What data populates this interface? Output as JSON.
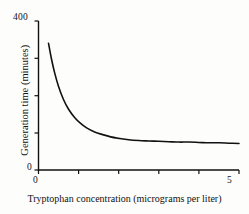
{
  "chart_data": {
    "type": "line",
    "title": "",
    "subtitle": "",
    "xlabel": "Tryptophan concentration (micrograms per liter)",
    "ylabel": "Generation time (minutes)",
    "xlim": [
      0,
      5
    ],
    "ylim": [
      0,
      400
    ],
    "xticks": [
      0,
      1,
      2,
      3,
      4,
      5
    ],
    "yticks": [
      0,
      100,
      200,
      300,
      400
    ],
    "xtick_labels": [
      "0",
      "",
      "",
      "",
      "",
      "5"
    ],
    "ytick_labels": [
      "0",
      "",
      "",
      "",
      "400"
    ],
    "grid": false,
    "legend": null,
    "annotations": [],
    "series": [
      {
        "name": "Generation time vs tryptophan concentration",
        "color": "#111111",
        "linewidth": 1.6,
        "x": [
          0.25,
          0.32,
          0.4,
          0.5,
          0.62,
          0.75,
          0.9,
          1.05,
          1.2,
          1.4,
          1.6,
          1.8,
          2.0,
          2.25,
          2.5,
          2.75,
          3.0,
          3.25,
          3.5,
          3.75,
          4.0,
          4.25,
          4.5,
          4.75,
          5.0
        ],
        "y": [
          340,
          300,
          262,
          224,
          190,
          163,
          141,
          125,
          113,
          102,
          95,
          89,
          85,
          81,
          79,
          78,
          77,
          76,
          75,
          75,
          74,
          73,
          73,
          72,
          71
        ]
      }
    ]
  },
  "axis": {
    "y_max_label": "400",
    "y_min_label": "0",
    "x_min_label": "0",
    "x_max_label": "5",
    "y_axis_title": "Generation time (minutes)",
    "x_axis_title": "Tryptophan concentration (micrograms per liter)"
  },
  "style": {
    "axis_color": "#111111",
    "curve_color": "#111111",
    "background": "#fdfdfc",
    "text_color": "#111111"
  }
}
